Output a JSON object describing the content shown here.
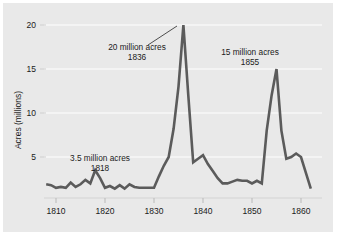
{
  "chart_data": {
    "type": "line",
    "title": "",
    "xlabel": "",
    "ylabel": "Acres (millions)",
    "xlim": [
      1808,
      1862
    ],
    "ylim": [
      0.8,
      20.6
    ],
    "xticks": [
      1810,
      1820,
      1830,
      1840,
      1850,
      1860
    ],
    "xticklabels": [
      "1810",
      "1820",
      "1830",
      "1840",
      "1850",
      "1860"
    ],
    "yticks": [
      5,
      10,
      15,
      20
    ],
    "yticklabels": [
      "5",
      "10",
      "15",
      "20"
    ],
    "grid": "horizontal-white-gridlines",
    "legend": "none",
    "series": [
      {
        "name": "Public land sales",
        "x": [
          1808,
          1809,
          1810,
          1811,
          1812,
          1813,
          1814,
          1815,
          1816,
          1817,
          1818,
          1819,
          1820,
          1821,
          1822,
          1823,
          1824,
          1825,
          1826,
          1827,
          1828,
          1829,
          1830,
          1831,
          1832,
          1833,
          1834,
          1835,
          1836,
          1837,
          1838,
          1839,
          1840,
          1841,
          1842,
          1843,
          1844,
          1845,
          1846,
          1847,
          1848,
          1849,
          1850,
          1851,
          1852,
          1853,
          1854,
          1855,
          1856,
          1857,
          1858,
          1859,
          1860,
          1861,
          1862
        ],
        "values": [
          1.9,
          1.8,
          1.5,
          1.6,
          1.5,
          2.1,
          1.6,
          1.9,
          2.4,
          2.0,
          3.5,
          2.6,
          1.5,
          1.7,
          1.4,
          1.8,
          1.4,
          1.9,
          1.6,
          1.5,
          1.5,
          1.5,
          1.5,
          2.8,
          4.0,
          5.0,
          8.2,
          13.0,
          20.0,
          12.0,
          4.4,
          4.8,
          5.2,
          4.2,
          3.4,
          2.6,
          2.0,
          2.0,
          2.2,
          2.4,
          2.3,
          2.3,
          2.0,
          2.3,
          2.0,
          8.0,
          12.0,
          15.0,
          8.0,
          4.8,
          5.0,
          5.4,
          5.0,
          3.2,
          1.4
        ]
      }
    ],
    "annotations": [
      {
        "id": "peak-1836",
        "line1": "20 million acres",
        "line2": "1836",
        "points_to_year": 1836,
        "points_to_value": 20
      },
      {
        "id": "peak-1855",
        "line1": "15 million acres",
        "line2": "1855",
        "points_to_year": 1855,
        "points_to_value": 15
      },
      {
        "id": "peak-1818",
        "line1": "3.5 million acres",
        "line2": "1818",
        "points_to_year": 1818,
        "points_to_value": 3.5
      }
    ],
    "colors": {
      "line": "#5b5b5b",
      "panel_background": "#e9e9e9",
      "figure_background": "#ffffff",
      "gridline": "#f7f7f7",
      "axis": "#d8d8d8",
      "text": "#1a1a1a"
    }
  }
}
